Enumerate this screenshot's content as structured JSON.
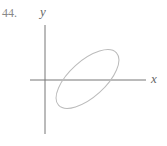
{
  "problem_number": "44.",
  "axes": {
    "x_label": "x",
    "y_label": "y"
  },
  "figure": {
    "shape": "ellipse",
    "colors": {
      "axes": "#777777",
      "ellipse": "#bbbbbb"
    }
  }
}
